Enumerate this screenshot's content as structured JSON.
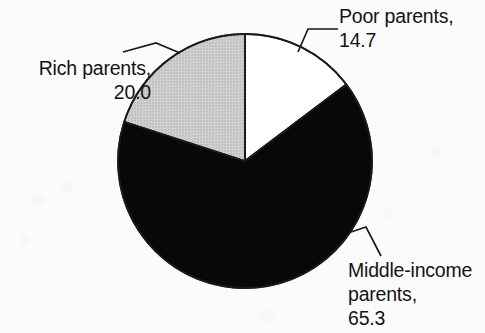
{
  "chart_data": {
    "type": "pie",
    "title": "",
    "subtitle": "",
    "xlabel": "",
    "ylabel": "",
    "legend_position": "none",
    "grid": false,
    "start_angle_deg": 0,
    "direction": "clockwise",
    "units": "percent",
    "total": 100.0,
    "categories": [
      "Poor parents",
      "Middle-income parents",
      "Rich parents"
    ],
    "values": [
      14.7,
      65.3,
      20.0
    ],
    "slice_colors": [
      "#ffffff",
      "#080808",
      "#c8c8c8"
    ],
    "slices": [
      {
        "name": "Poor parents",
        "value": 14.7,
        "value_text": "14.7",
        "color": "#ffffff",
        "fill_style": "white",
        "start_deg": 0.0,
        "end_deg": 52.92,
        "label_lines": [
          "Poor parents,",
          "14.7"
        ]
      },
      {
        "name": "Middle-income parents",
        "value": 65.3,
        "value_text": "65.3",
        "color": "#080808",
        "fill_style": "solid-black",
        "start_deg": 52.92,
        "end_deg": 288.0,
        "label_lines": [
          "Middle-income",
          "parents,",
          "65.3"
        ]
      },
      {
        "name": "Rich parents",
        "value": 20.0,
        "value_text": "20.0",
        "color": "#c8c8c8",
        "fill_style": "stippled-gray",
        "start_deg": 288.0,
        "end_deg": 360.0,
        "label_lines": [
          "Rich parents,",
          "20.0"
        ]
      }
    ]
  },
  "labels": {
    "poor": {
      "line1": "Poor parents,",
      "line2": "14.7"
    },
    "rich": {
      "line1": "Rich parents,",
      "line2": "20.0"
    },
    "middle": {
      "line1": "Middle-income",
      "line2": "parents,",
      "line3": "65.3"
    }
  },
  "colors": {
    "background": "#fbfbfb",
    "outline": "#1a1a1a",
    "black_slice": "#080808",
    "gray_slice": "#c8c8c8",
    "white_slice": "#ffffff",
    "text": "#141414"
  },
  "geometry": {
    "center_x": 245,
    "center_y": 161,
    "radius": 127
  }
}
